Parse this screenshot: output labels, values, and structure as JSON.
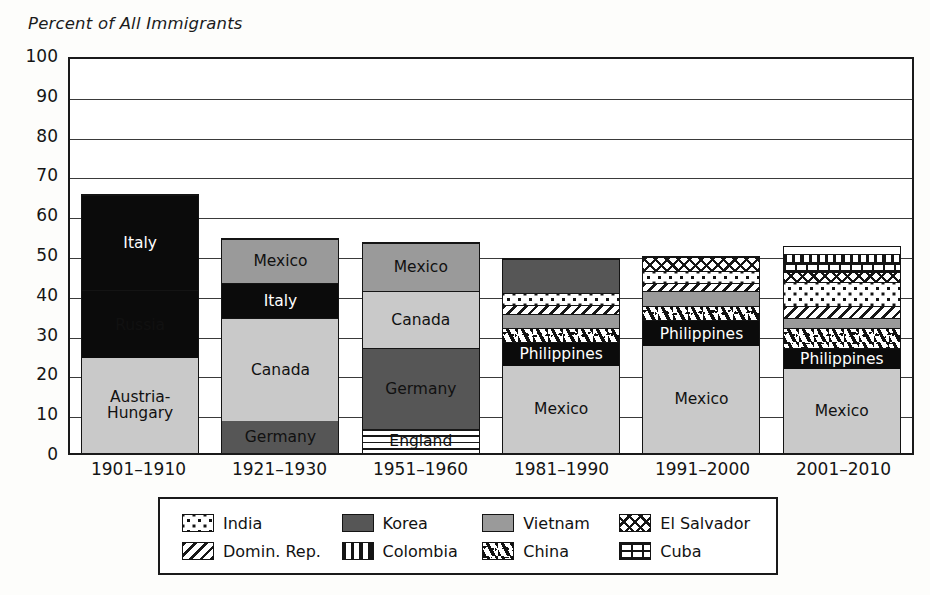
{
  "axis": {
    "title": "Percent of All Immigrants",
    "y_ticks": [
      "100",
      "90",
      "80",
      "70",
      "60",
      "50",
      "40",
      "30",
      "20",
      "10",
      "0"
    ],
    "x_labels": [
      "1901–1910",
      "1921–1930",
      "1951–1960",
      "1981–1990",
      "1991–2000",
      "2001–2010"
    ]
  },
  "legend": {
    "rows": [
      [
        {
          "label": "India",
          "pattern": "dots"
        },
        {
          "label": "Korea",
          "pattern": "darkgray"
        },
        {
          "label": "Vietnam",
          "pattern": "medgray"
        },
        {
          "label": "El Salvador",
          "pattern": "cross"
        }
      ],
      [
        {
          "label": "Domin. Rep.",
          "pattern": "diag"
        },
        {
          "label": "Colombia",
          "pattern": "vbars"
        },
        {
          "label": "China",
          "pattern": "squig"
        },
        {
          "label": "Cuba",
          "pattern": "brick"
        }
      ]
    ]
  },
  "chart_data": {
    "type": "bar",
    "subtype": "stacked",
    "title": "",
    "xlabel": "",
    "ylabel": "Percent of All Immigrants",
    "ylim": [
      0,
      100
    ],
    "ytick_step": 10,
    "grid": true,
    "legend_position": "bottom",
    "categories": [
      "1901–1910",
      "1921–1930",
      "1951–1960",
      "1981–1990",
      "1991–2000",
      "2001–2010"
    ],
    "totals": [
      65,
      54,
      53,
      49,
      49.5,
      52
    ],
    "bars": [
      {
        "category": "1901–1910",
        "total": 65,
        "segments": [
          {
            "name": "Austria-Hungary",
            "value": 24,
            "label": "Austria-\nHungary",
            "pattern": "litegray",
            "label_color": "dark"
          },
          {
            "name": "Russia",
            "value": 17,
            "label": "Russia",
            "pattern": "black",
            "label_color": "dark"
          },
          {
            "name": "Italy",
            "value": 24,
            "label": "Italy",
            "pattern": "black",
            "label_color": "light"
          }
        ]
      },
      {
        "category": "1921–1930",
        "total": 54,
        "segments": [
          {
            "name": "Germany",
            "value": 8,
            "label": "Germany",
            "pattern": "darkgray",
            "label_color": "dark"
          },
          {
            "name": "Canada",
            "value": 26,
            "label": "Canada",
            "pattern": "litegray",
            "label_color": "dark"
          },
          {
            "name": "Italy",
            "value": 9,
            "label": "Italy",
            "pattern": "black",
            "label_color": "light"
          },
          {
            "name": "Mexico",
            "value": 11,
            "label": "Mexico",
            "pattern": "medgray",
            "label_color": "dark"
          }
        ]
      },
      {
        "category": "1951–1960",
        "total": 53,
        "segments": [
          {
            "name": "England",
            "value": 6,
            "label": "England",
            "pattern": "hlines",
            "label_color": "dark"
          },
          {
            "name": "Germany",
            "value": 20.5,
            "label": "Germany",
            "pattern": "darkgray",
            "label_color": "dark"
          },
          {
            "name": "Canada",
            "value": 14.5,
            "label": "Canada",
            "pattern": "litegray",
            "label_color": "dark"
          },
          {
            "name": "Mexico",
            "value": 12,
            "label": "Mexico",
            "pattern": "medgray",
            "label_color": "dark"
          }
        ]
      },
      {
        "category": "1981–1990",
        "total": 49,
        "segments": [
          {
            "name": "Mexico",
            "value": 22,
            "label": "Mexico",
            "pattern": "litegray",
            "label_color": "dark"
          },
          {
            "name": "Philippines",
            "value": 6,
            "label": "Philippines",
            "pattern": "black",
            "label_color": "light"
          },
          {
            "name": "China",
            "value": 3.5,
            "label": "",
            "pattern": "squig",
            "label_color": "dark"
          },
          {
            "name": "Vietnam",
            "value": 3.5,
            "label": "",
            "pattern": "medgray",
            "label_color": "dark"
          },
          {
            "name": "Domin. Rep.",
            "value": 2.5,
            "label": "",
            "pattern": "diag",
            "label_color": "dark"
          },
          {
            "name": "India",
            "value": 3,
            "label": "",
            "pattern": "dots",
            "label_color": "dark"
          },
          {
            "name": "Korea",
            "value": 8.5,
            "label": "",
            "pattern": "darkgray",
            "label_color": "dark"
          }
        ]
      },
      {
        "category": "1991–2000",
        "total": 49.5,
        "segments": [
          {
            "name": "Mexico",
            "value": 27,
            "label": "Mexico",
            "pattern": "litegray",
            "label_color": "dark"
          },
          {
            "name": "Philippines",
            "value": 6.5,
            "label": "Philippines",
            "pattern": "black",
            "label_color": "light"
          },
          {
            "name": "China",
            "value": 3.5,
            "label": "",
            "pattern": "squig",
            "label_color": "dark"
          },
          {
            "name": "Vietnam",
            "value": 4,
            "label": "",
            "pattern": "medgray",
            "label_color": "dark"
          },
          {
            "name": "Domin. Rep.",
            "value": 2,
            "label": "",
            "pattern": "diag",
            "label_color": "dark"
          },
          {
            "name": "India",
            "value": 3,
            "label": "",
            "pattern": "dots",
            "label_color": "dark"
          },
          {
            "name": "El Salvador",
            "value": 3.5,
            "label": "",
            "pattern": "cross",
            "label_color": "dark"
          }
        ]
      },
      {
        "category": "2001–2010",
        "total": 52,
        "segments": [
          {
            "name": "Mexico",
            "value": 21,
            "label": "Mexico",
            "pattern": "litegray",
            "label_color": "dark"
          },
          {
            "name": "Philippines",
            "value": 5.5,
            "label": "Philippines",
            "pattern": "black",
            "label_color": "light"
          },
          {
            "name": "China",
            "value": 5,
            "label": "",
            "pattern": "squig",
            "label_color": "dark"
          },
          {
            "name": "Vietnam",
            "value": 2.5,
            "label": "",
            "pattern": "medgray",
            "label_color": "dark"
          },
          {
            "name": "Domin. Rep.",
            "value": 3,
            "label": "",
            "pattern": "diag",
            "label_color": "dark"
          },
          {
            "name": "India",
            "value": 6,
            "label": "",
            "pattern": "dots",
            "label_color": "dark"
          },
          {
            "name": "El Salvador",
            "value": 2.5,
            "label": "",
            "pattern": "cross",
            "label_color": "dark"
          },
          {
            "name": "Cuba",
            "value": 2.5,
            "label": "",
            "pattern": "brick",
            "label_color": "dark"
          },
          {
            "name": "Colombia",
            "value": 2,
            "label": "",
            "pattern": "vbars",
            "label_color": "dark"
          }
        ]
      }
    ]
  }
}
